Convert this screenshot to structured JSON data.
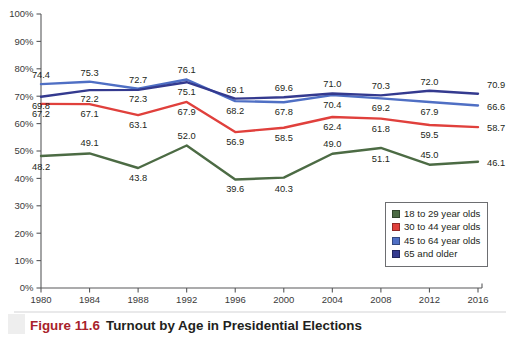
{
  "figure": {
    "number_label": "Figure 11.6",
    "title": "Turnout by Age in Presidential Elections"
  },
  "legend": {
    "position": "inside-bottom-right",
    "entries": [
      {
        "label": "18 to 29 year olds",
        "color": "#4c6b44"
      },
      {
        "label": "30 to 44 year olds",
        "color": "#e0403c"
      },
      {
        "label": "45 to 64 year olds",
        "color": "#4f6fc4"
      },
      {
        "label": "65 and older",
        "color": "#343a8f"
      }
    ]
  },
  "chart_data": {
    "type": "line",
    "title": "Turnout by Age in Presidential Elections",
    "xlabel": "",
    "ylabel": "",
    "grid": false,
    "ylim": [
      0,
      100
    ],
    "ytick_labels": [
      "0%",
      "10%",
      "20%",
      "30%",
      "40%",
      "50%",
      "60%",
      "70%",
      "80%",
      "90%",
      "100%"
    ],
    "ytick_values": [
      0,
      10,
      20,
      30,
      40,
      50,
      60,
      70,
      80,
      90,
      100
    ],
    "categories": [
      "1980",
      "1984",
      "1988",
      "1992",
      "1996",
      "2000",
      "2004",
      "2008",
      "2012",
      "2016"
    ],
    "x": [
      1980,
      1984,
      1988,
      1992,
      1996,
      2000,
      2004,
      2008,
      2012,
      2016
    ],
    "series": [
      {
        "name": "18 to 29 year olds",
        "color": "#4c6b44",
        "values": [
          48.2,
          49.1,
          43.8,
          52.0,
          39.6,
          40.3,
          49.0,
          51.1,
          45.0,
          46.1
        ]
      },
      {
        "name": "30 to 44 year olds",
        "color": "#e0403c",
        "values": [
          67.2,
          67.1,
          63.1,
          67.9,
          56.9,
          58.5,
          62.4,
          61.8,
          59.5,
          58.7
        ]
      },
      {
        "name": "45 to 64 year olds",
        "color": "#4f6fc4",
        "values": [
          74.4,
          75.3,
          72.7,
          76.1,
          68.2,
          67.8,
          70.4,
          69.2,
          67.9,
          66.6
        ]
      },
      {
        "name": "65 and older",
        "color": "#343a8f",
        "values": [
          69.8,
          72.2,
          72.3,
          75.1,
          69.1,
          69.6,
          71.0,
          70.3,
          72.0,
          70.9
        ]
      }
    ]
  }
}
